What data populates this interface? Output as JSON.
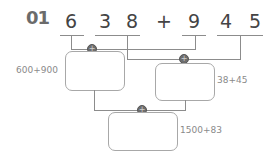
{
  "problem": {
    "number": "01",
    "expression": {
      "left_digits": [
        "6",
        "3",
        "8"
      ],
      "operator": "+",
      "right_digits": [
        "9",
        "4",
        "5"
      ]
    }
  },
  "decomposition": {
    "groups": [
      {
        "digits": "6",
        "place": "hundreds-left"
      },
      {
        "digits": "38",
        "place": "tens-ones-left"
      },
      {
        "digits": "9",
        "place": "hundreds-right"
      },
      {
        "digits": "45",
        "place": "tens-ones-right"
      }
    ]
  },
  "boxes": [
    {
      "id": "box-1",
      "hint": "600+900",
      "value": ""
    },
    {
      "id": "box-2",
      "hint": "38+45",
      "value": ""
    },
    {
      "id": "box-3",
      "hint": "1500+83",
      "value": ""
    }
  ],
  "plus_marker": "+",
  "colors": {
    "lines": "#8c8c8c",
    "digits": "#444444",
    "hint_text": "#8a8a8a",
    "marker": "#6e6e6e"
  }
}
